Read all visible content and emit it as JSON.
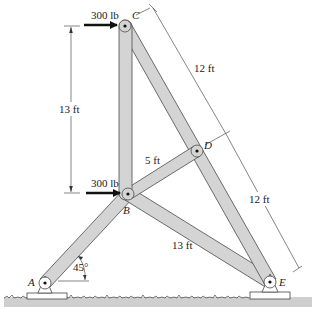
{
  "figure": {
    "joints": {
      "A": {
        "label": "A"
      },
      "B": {
        "label": "B"
      },
      "C": {
        "label": "C"
      },
      "D": {
        "label": "D"
      },
      "E": {
        "label": "E"
      }
    },
    "loads": {
      "at_C": "300 lb",
      "at_B": "300 lb"
    },
    "dimensions": {
      "BC_vertical": "13 ft",
      "CD": "12 ft",
      "DE": "12 ft",
      "BD": "5 ft",
      "BE": "13 ft"
    },
    "angle": {
      "at_A": "45°"
    },
    "members": [
      "AB",
      "BC",
      "BD",
      "BE",
      "CD",
      "DE"
    ],
    "colors": {
      "member_fill": "#d4d4d4",
      "member_stroke": "#4a4a4a",
      "ground": "#cfcfcf"
    }
  }
}
